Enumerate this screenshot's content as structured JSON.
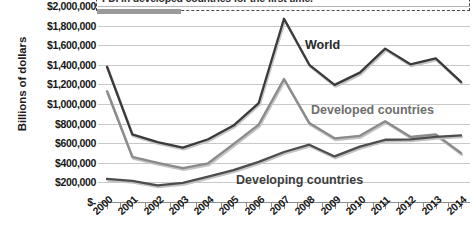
{
  "chart_data": {
    "type": "line",
    "title": "",
    "xlabel": "",
    "ylabel": "Billions of dollars",
    "ylim": [
      0,
      2000000
    ],
    "ytick_labels": [
      "$2,000,000",
      "$1,800,000",
      "$1,600,000",
      "$1,400,000",
      "$1,200,000",
      "$1,000,000",
      "$800,000",
      "$600,000",
      "$400,000",
      "$200,000",
      "$-"
    ],
    "ytick_values": [
      2000000,
      1800000,
      1600000,
      1400000,
      1200000,
      1000000,
      800000,
      600000,
      400000,
      200000,
      0
    ],
    "grid": true,
    "legend_position": "inline-labels",
    "x": [
      "2000",
      "2001",
      "2002",
      "2003",
      "2004",
      "2005",
      "2006",
      "2007",
      "2008",
      "2009",
      "2010",
      "2011",
      "2012",
      "2013",
      "2014"
    ],
    "categories": [
      "2000",
      "2001",
      "2002",
      "2003",
      "2004",
      "2005",
      "2006",
      "2007",
      "2008",
      "2009",
      "2010",
      "2011",
      "2012",
      "2013",
      "2014"
    ],
    "series": [
      {
        "name": "World",
        "color": "#3a3a3a",
        "values": [
          1380000,
          690000,
          610000,
          555000,
          640000,
          780000,
          1010000,
          1870000,
          1400000,
          1195000,
          1320000,
          1565000,
          1405000,
          1465000,
          1225000
        ]
      },
      {
        "name": "Developed countries",
        "color": "#8a8a8a",
        "values": [
          1130000,
          460000,
          400000,
          345000,
          395000,
          590000,
          790000,
          1255000,
          805000,
          650000,
          675000,
          825000,
          665000,
          690000,
          500000
        ]
      },
      {
        "name": "Developing countries",
        "color": "#4d4d4d",
        "values": [
          235000,
          215000,
          170000,
          195000,
          260000,
          325000,
          410000,
          510000,
          585000,
          465000,
          565000,
          635000,
          640000,
          665000,
          680000
        ]
      }
    ],
    "annotations": [
      {
        "name": "fdi-callout",
        "text": "FDI in developed countries for the first time.",
        "style": "dashed-box"
      }
    ],
    "series_labels": [
      {
        "name": "World",
        "text": "World"
      },
      {
        "name": "Developed countries",
        "text": "Developed countries"
      },
      {
        "name": "Developing countries",
        "text": "Developing countries"
      }
    ]
  }
}
